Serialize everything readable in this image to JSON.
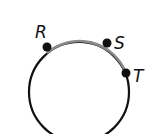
{
  "diagram": {
    "type": "circle-with-points",
    "circle": {
      "cx": 79,
      "cy": 92,
      "r": 50,
      "stroke": "#111111"
    },
    "highlighted_arc": {
      "from": "R",
      "to": "T",
      "through": "S",
      "color": "#8a8a8a"
    },
    "points": [
      {
        "label": "R",
        "x": 47,
        "y": 46,
        "lx": 35,
        "ly": 37
      },
      {
        "label": "S",
        "x": 107,
        "y": 43,
        "lx": 114,
        "ly": 48
      },
      {
        "label": "T",
        "x": 126,
        "y": 73,
        "lx": 133,
        "ly": 82
      }
    ]
  }
}
